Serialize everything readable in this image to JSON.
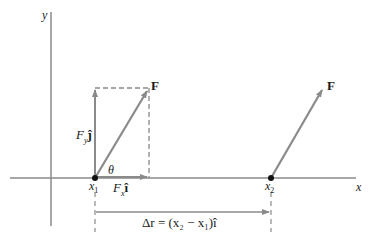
{
  "diagram": {
    "title": "",
    "axes": {
      "x_label": "x",
      "y_label": "y"
    },
    "labels": {
      "force_left": "F",
      "force_right": "F",
      "fy_component": "F",
      "fy_sub": "y",
      "fy_unit": "ĵ",
      "fx_component": "F",
      "fx_sub": "x",
      "fx_unit": "î",
      "theta": "θ",
      "x1": "x",
      "x1_sub": "1",
      "x2": "x",
      "x2_sub": "2",
      "displacement": "Δr = (x₂ − x₁)î"
    },
    "colors": {
      "axis": "#8a8a8a",
      "arrow": "#8a8a8a",
      "dashed": "#8a8a8a",
      "point": "#111111",
      "text": "#1a1a1a"
    }
  }
}
